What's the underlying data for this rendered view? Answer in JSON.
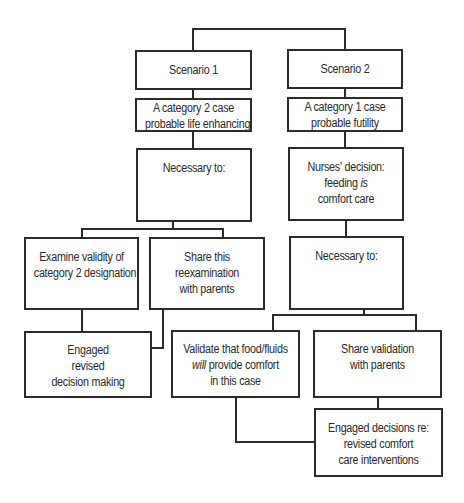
{
  "diagram": {
    "type": "flowchart",
    "nodes": {
      "scenario1": {
        "lines": [
          "Scenario 1"
        ]
      },
      "scenario2": {
        "lines": [
          "Scenario 2"
        ]
      },
      "cat2": {
        "lines": [
          "A category 2 case",
          "probable life enhancing"
        ]
      },
      "cat1": {
        "lines": [
          "A category 1 case",
          "probable futility"
        ]
      },
      "necessary_left": {
        "lines": [
          "Necessary to:"
        ]
      },
      "nurses": {
        "line1": "Nurses' decision:",
        "line2_pre": "feeding ",
        "line2_em": "is",
        "line3": "comfort care"
      },
      "examine": {
        "lines": [
          "Examine validity of",
          "category 2 designation"
        ]
      },
      "share_reexam": {
        "lines": [
          "Share this",
          "reexamination",
          "with parents"
        ]
      },
      "necessary_right": {
        "lines": [
          "Necessary to:"
        ]
      },
      "engaged_revised": {
        "lines": [
          "Engaged",
          "revised",
          "decision making"
        ]
      },
      "validate": {
        "line1": "Validate that food/fluids",
        "line2_em": "will",
        "line2_post": " provide comfort",
        "line3": "in this case"
      },
      "share_validation": {
        "lines": [
          "Share validation",
          "with parents"
        ]
      },
      "engaged_comfort": {
        "lines": [
          "Engaged decisions re:",
          "revised comfort",
          "care interventions"
        ]
      }
    },
    "edges": [
      [
        "root",
        "scenario1"
      ],
      [
        "root",
        "scenario2"
      ],
      [
        "scenario1",
        "cat2"
      ],
      [
        "cat2",
        "necessary_left"
      ],
      [
        "necessary_left",
        "examine"
      ],
      [
        "necessary_left",
        "share_reexam"
      ],
      [
        "examine",
        "engaged_revised"
      ],
      [
        "share_reexam",
        "engaged_revised"
      ],
      [
        "scenario2",
        "cat1"
      ],
      [
        "cat1",
        "nurses"
      ],
      [
        "nurses",
        "necessary_right"
      ],
      [
        "necessary_right",
        "validate"
      ],
      [
        "necessary_right",
        "share_validation"
      ],
      [
        "validate",
        "engaged_comfort"
      ],
      [
        "share_validation",
        "engaged_comfort"
      ]
    ]
  }
}
